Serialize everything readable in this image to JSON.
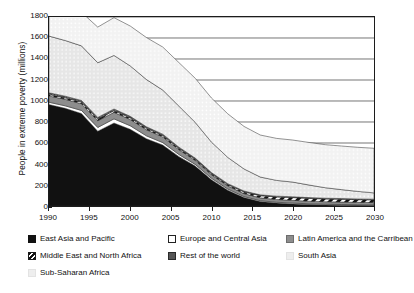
{
  "chart_data": {
    "type": "area",
    "title": "",
    "xlabel": "",
    "ylabel": "People in extreme poverty (millions)",
    "stacked": true,
    "grid": true,
    "legend_position": "bottom",
    "xlim": [
      1990,
      2030
    ],
    "ylim": [
      0,
      1800
    ],
    "xticks": [
      1990,
      1995,
      2000,
      2005,
      2010,
      2015,
      2020,
      2025,
      2030
    ],
    "yticks": [
      0,
      200,
      400,
      600,
      800,
      1000,
      1200,
      1400,
      1600,
      1800
    ],
    "x": [
      1990,
      1992,
      1994,
      1996,
      1998,
      2000,
      2002,
      2004,
      2006,
      2008,
      2010,
      2012,
      2014,
      2016,
      2018,
      2020,
      2022,
      2024,
      2026,
      2028,
      2030
    ],
    "series": [
      {
        "name": "East Asia and Pacific",
        "color": "#111111",
        "pattern": "solid",
        "values": [
          966,
          930,
          880,
          712,
          790,
          730,
          640,
          580,
          470,
          380,
          250,
          150,
          80,
          42,
          28,
          20,
          14,
          10,
          8,
          6,
          5
        ]
      },
      {
        "name": "Europe and Central Asia",
        "color": "#ffffff",
        "pattern": "solid",
        "values": [
          22,
          24,
          30,
          36,
          40,
          34,
          28,
          24,
          20,
          16,
          14,
          12,
          10,
          9,
          8,
          8,
          7,
          7,
          6,
          6,
          6
        ]
      },
      {
        "name": "Latin America and the Carribean",
        "color": "#8d8d8d",
        "pattern": "solid",
        "values": [
          60,
          62,
          64,
          64,
          62,
          60,
          58,
          54,
          46,
          38,
          34,
          30,
          28,
          27,
          26,
          26,
          25,
          24,
          24,
          23,
          22
        ]
      },
      {
        "name": "Middle East and North Africa",
        "color": "#ffffff",
        "pattern": "diagonal-hatch",
        "values": [
          14,
          14,
          15,
          16,
          16,
          15,
          14,
          13,
          12,
          11,
          10,
          12,
          16,
          20,
          24,
          26,
          26,
          26,
          26,
          25,
          25
        ]
      },
      {
        "name": "Rest of the world",
        "color": "#555555",
        "pattern": "dark-dot",
        "values": [
          16,
          16,
          16,
          16,
          16,
          15,
          14,
          13,
          12,
          11,
          10,
          9,
          9,
          8,
          8,
          8,
          8,
          7,
          7,
          7,
          7
        ]
      },
      {
        "name": "South Asia",
        "color": "#ededed",
        "pattern": "light-dot",
        "values": [
          540,
          530,
          520,
          520,
          510,
          480,
          450,
          420,
          390,
          340,
          290,
          250,
          210,
          170,
          150,
          140,
          120,
          100,
          85,
          72,
          60
        ]
      },
      {
        "name": "Sub-Saharan Africa",
        "color": "#f3f3f3",
        "pattern": "light-dot",
        "values": [
          280,
          300,
          320,
          340,
          360,
          380,
          400,
          410,
          415,
          420,
          420,
          415,
          405,
          400,
          400,
          400,
          405,
          410,
          415,
          420,
          425
        ]
      }
    ],
    "totals_note": "Values are stacked; topmost boundary is the sum of all regions."
  },
  "legend": {
    "items": [
      {
        "label": "East Asia and Pacific",
        "swatch": "sw-solid-black",
        "name": "legend-east-asia-and-pacific"
      },
      {
        "label": "Europe and Central Asia",
        "swatch": "sw-white",
        "name": "legend-europe-and-central-asia"
      },
      {
        "label": "Latin America and the Carribean",
        "swatch": "sw-midgray",
        "name": "legend-latin-america-and-the-carribean"
      },
      {
        "label": "Middle East and North Africa",
        "swatch": "sw-hatch",
        "name": "legend-middle-east-and-north-africa"
      },
      {
        "label": "Rest of the world",
        "swatch": "sw-darkdot",
        "name": "legend-rest-of-the-world"
      },
      {
        "label": "South Asia",
        "swatch": "sw-lightdot",
        "name": "legend-south-asia"
      },
      {
        "label": "Sub-Saharan Africa",
        "swatch": "sw-lightdot",
        "name": "legend-sub-saharan-africa"
      }
    ]
  }
}
